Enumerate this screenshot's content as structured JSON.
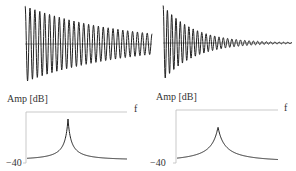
{
  "colors": {
    "waveform": "#222222",
    "axis": "#bbbbbb",
    "text": "#333333",
    "background": "#ffffff"
  },
  "panels": [
    {
      "id": "low-damping",
      "time_signal": {
        "description": "slowly decaying sinusoid",
        "cycles": 26,
        "decay": 1.3
      },
      "spectrum": {
        "ylabel": "Amp [dB]",
        "xlabel": "f",
        "ymin_label": "−40",
        "peak": "narrow, sharp"
      }
    },
    {
      "id": "high-damping",
      "time_signal": {
        "description": "quickly decaying sinusoid",
        "cycles": 30,
        "decay": 4.2
      },
      "spectrum": {
        "ylabel": "Amp [dB]",
        "xlabel": "f",
        "ymin_label": "−40",
        "peak": "broad, lower"
      }
    }
  ]
}
